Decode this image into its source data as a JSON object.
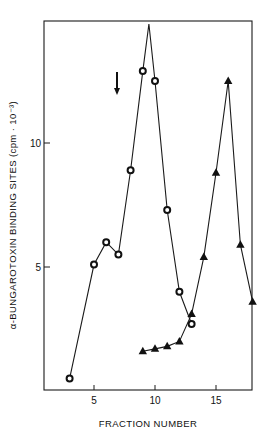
{
  "chart_data": {
    "type": "line",
    "title": "",
    "xlabel": "FRACTION NUMBER",
    "ylabel": "α-BUNGAROTOXIN BINDING SITES (cpm · 10⁻³)",
    "xlim": [
      0.8,
      18
    ],
    "ylim": [
      0,
      15
    ],
    "xticks": [
      5,
      10,
      15
    ],
    "xtick_labels": [
      "5",
      "10",
      "15"
    ],
    "yticks": [
      5,
      10
    ],
    "ytick_labels": [
      "5",
      "10"
    ],
    "grid": false,
    "legend": null,
    "series": [
      {
        "name": "circles",
        "marker": "open-circle",
        "x": [
          3,
          5,
          6,
          7,
          8,
          9,
          10,
          11,
          12,
          13
        ],
        "values": [
          0.5,
          5.1,
          6.0,
          5.5,
          8.9,
          12.9,
          12.5,
          7.3,
          4.0,
          2.7
        ],
        "line_peak": {
          "x": 9.5,
          "y": 14.8
        }
      },
      {
        "name": "triangles",
        "marker": "filled-triangle",
        "x": [
          9,
          10,
          11,
          12,
          13,
          14,
          15,
          16,
          17,
          18
        ],
        "values": [
          1.6,
          1.7,
          1.8,
          2.0,
          3.1,
          5.4,
          8.8,
          12.5,
          5.9,
          3.6
        ]
      }
    ],
    "annotations": [
      {
        "type": "arrow-down",
        "x": 7,
        "y_from": 12.8,
        "y_to": 11.9
      }
    ]
  }
}
